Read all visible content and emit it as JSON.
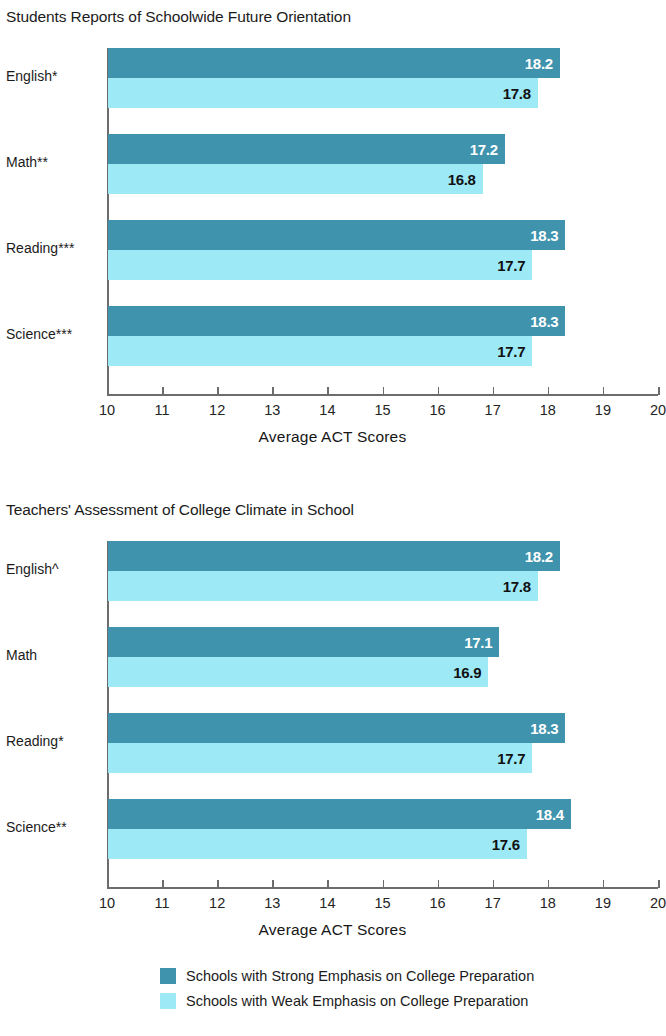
{
  "colors": {
    "strong": "#3f93ad",
    "weak": "#9de9f6",
    "axis": "#6c6c6c",
    "text": "#1b1b1b"
  },
  "axis": {
    "title": "Average ACT Scores",
    "ticks": [
      "10",
      "11",
      "12",
      "13",
      "14",
      "15",
      "16",
      "17",
      "18",
      "19",
      "20"
    ],
    "min": 10,
    "max": 20
  },
  "legend": {
    "items": [
      {
        "label": "Schools with Strong Emphasis on College Preparation",
        "color": "#3f93ad"
      },
      {
        "label": "Schools with Weak Emphasis on College Preparation",
        "color": "#9de9f6"
      }
    ]
  },
  "charts": [
    {
      "title": "Students Reports of Schoolwide Future Orientation",
      "categories": [
        "English*",
        "Math**",
        "Reading***",
        "Science***"
      ],
      "strong": [
        "18.2",
        "17.2",
        "18.3",
        "18.3"
      ],
      "weak": [
        "17.8",
        "16.8",
        "17.7",
        "17.7"
      ]
    },
    {
      "title": "Teachers' Assessment of College Climate in School",
      "categories": [
        "English^",
        "Math",
        "Reading*",
        "Science**"
      ],
      "strong": [
        "18.2",
        "17.1",
        "18.3",
        "18.4"
      ],
      "weak": [
        "17.8",
        "16.9",
        "17.7",
        "17.6"
      ]
    }
  ],
  "chart_data": [
    {
      "type": "bar",
      "title": "Students Reports of Schoolwide Future Orientation",
      "orientation": "horizontal",
      "categories": [
        "English*",
        "Math**",
        "Reading***",
        "Science***"
      ],
      "series": [
        {
          "name": "Schools with Strong Emphasis on College Preparation",
          "values": [
            18.2,
            17.2,
            18.3,
            18.3
          ],
          "color": "#3f93ad"
        },
        {
          "name": "Schools with Weak Emphasis on College Preparation",
          "values": [
            17.8,
            16.8,
            17.7,
            17.7
          ],
          "color": "#9de9f6"
        }
      ],
      "xlabel": "Average ACT Scores",
      "ylabel": "",
      "xlim": [
        10,
        20
      ],
      "xticks": [
        10,
        11,
        12,
        13,
        14,
        15,
        16,
        17,
        18,
        19,
        20
      ],
      "grid": false,
      "legend_position": "bottom",
      "data_labels": true
    },
    {
      "type": "bar",
      "title": "Teachers' Assessment of College Climate in School",
      "orientation": "horizontal",
      "categories": [
        "English^",
        "Math",
        "Reading*",
        "Science**"
      ],
      "series": [
        {
          "name": "Schools with Strong Emphasis on College Preparation",
          "values": [
            18.2,
            17.1,
            18.3,
            18.4
          ],
          "color": "#3f93ad"
        },
        {
          "name": "Schools with Weak Emphasis on College Preparation",
          "values": [
            17.8,
            16.9,
            17.7,
            17.6
          ],
          "color": "#9de9f6"
        }
      ],
      "xlabel": "Average ACT Scores",
      "ylabel": "",
      "xlim": [
        10,
        20
      ],
      "xticks": [
        10,
        11,
        12,
        13,
        14,
        15,
        16,
        17,
        18,
        19,
        20
      ],
      "grid": false,
      "legend_position": "bottom",
      "data_labels": true
    }
  ]
}
